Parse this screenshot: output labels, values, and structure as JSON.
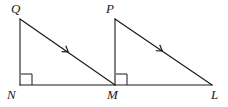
{
  "figure": {
    "width": 228,
    "height": 107,
    "background_color": "#ffffff",
    "stroke_color": "#1a1a1a",
    "label_color": "#1a1a1a"
  },
  "points": {
    "Q": {
      "label": "Q",
      "x": 20,
      "y": 19,
      "label_x": 11,
      "label_y": 2
    },
    "N": {
      "label": "N",
      "x": 20,
      "y": 85,
      "label_x": 7,
      "label_y": 88
    },
    "M": {
      "label": "M",
      "x": 115,
      "y": 85,
      "label_x": 107,
      "label_y": 88
    },
    "P": {
      "label": "P",
      "x": 115,
      "y": 19,
      "label_x": 106,
      "label_y": 2
    },
    "L": {
      "label": "L",
      "x": 212,
      "y": 85,
      "label_x": 211,
      "label_y": 88
    }
  },
  "segments": [
    {
      "name": "QN",
      "x1": 20,
      "y1": 19,
      "x2": 20,
      "y2": 85
    },
    {
      "name": "NL",
      "x1": 20,
      "y1": 85,
      "x2": 212,
      "y2": 85
    },
    {
      "name": "QM",
      "x1": 20,
      "y1": 19,
      "x2": 115,
      "y2": 85
    },
    {
      "name": "PM",
      "x1": 115,
      "y1": 19,
      "x2": 115,
      "y2": 85
    },
    {
      "name": "PL",
      "x1": 115,
      "y1": 19,
      "x2": 212,
      "y2": 85
    }
  ],
  "right_angles": [
    {
      "name": "angle-N",
      "vertex": "N",
      "x": 21,
      "y": 74,
      "size": 11
    },
    {
      "name": "angle-M",
      "vertex": "M",
      "x": 116,
      "y": 74,
      "size": 11
    }
  ],
  "tick_marks": [
    {
      "name": "tick-QM",
      "on_segment": "QM",
      "x": 67,
      "y": 51,
      "count": 1
    },
    {
      "name": "tick-PL",
      "on_segment": "PL",
      "x": 161,
      "y": 50,
      "count": 1
    }
  ]
}
